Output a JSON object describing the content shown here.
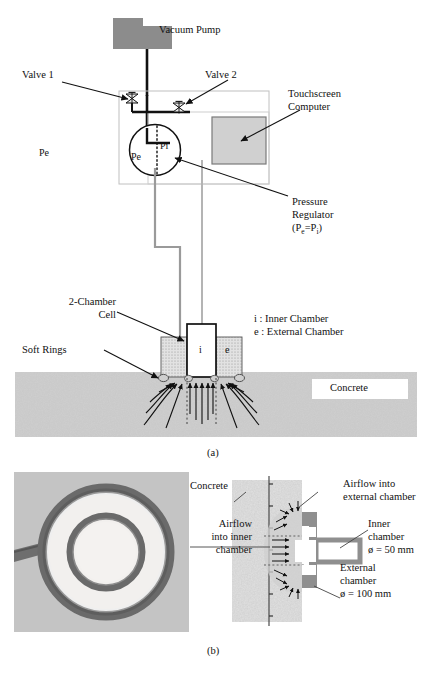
{
  "figure": {
    "panel_a_caption": "(a)",
    "panel_b_caption": "(b)"
  },
  "panel_a": {
    "labels": {
      "vacuum_pump": "Vacuum Pump",
      "valve_1": "Valve 1",
      "valve_2": "Valve 2",
      "touchscreen_computer_line1": "Touchscreen",
      "touchscreen_computer_line2": "Computer",
      "pressure_regulator_line1": "Pressure",
      "pressure_regulator_line2": "Regulator",
      "pressure_regulator_formula_open": "(P",
      "pressure_regulator_formula_sub_e": "e",
      "pressure_regulator_formula_eq": "=P",
      "pressure_regulator_formula_sub_i": "i",
      "pressure_regulator_formula_close": ")",
      "two_chamber_cell_line1": "2-Chamber",
      "two_chamber_cell_line2": "Cell",
      "soft_rings": "Soft Rings",
      "legend_inner": "i : Inner Chamber",
      "legend_external": "e : External Chamber",
      "concrete": "Concrete",
      "gauge_pe": "Pe",
      "gauge_pi": "Pi",
      "chamber_i": "i",
      "chamber_e": "e"
    }
  },
  "panel_b": {
    "labels": {
      "concrete": "Concrete",
      "airflow_external_line1": "Airflow into",
      "airflow_external_line2": "external chamber",
      "airflow_inner_line1": "Airflow",
      "airflow_inner_line2": "into inner",
      "airflow_inner_line3": "chamber",
      "inner_chamber_line1": "Inner",
      "inner_chamber_line2": "chamber",
      "inner_chamber_diameter": "ø = 50 mm",
      "external_chamber_line1": "External",
      "external_chamber_line2": "chamber",
      "external_chamber_diameter": "ø = 100 mm"
    }
  },
  "colors": {
    "pump_gray": "#8c8c8c",
    "tube_gray": "#9a9a9a",
    "enclosure_gray": "#c6c6c6",
    "screen_fill": "#d0d0d0",
    "screen_border": "#7a7a7a",
    "concrete_gray": "#b9b9b9",
    "cell_body_gray": "#8f8f8f",
    "hatch_gray": "#d8d8d8",
    "line_black": "#111111"
  }
}
